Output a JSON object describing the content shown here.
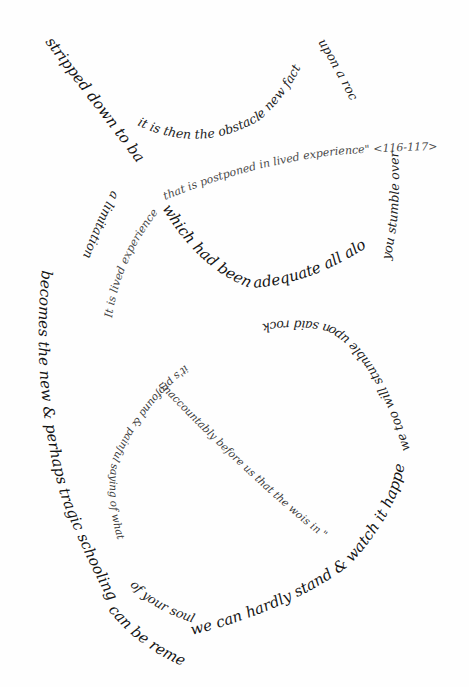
{
  "poem": {
    "colors": {
      "ink_dark": "#141414",
      "ink_light": "#4a4a4a",
      "paper": "#fefefe"
    },
    "lines": {
      "diagonal_top": "stripped down to basic words",
      "left_arc_a": "a limitation",
      "left_arc_b": "becomes the new & perhaps tragic schooling",
      "left_arc_c": "can be remembered",
      "top_loop": "it is then the obstacle new fact",
      "right_upper": "upon a rock",
      "right_side": "you stumble over",
      "big_loop_bottom": "which had been adequate all along",
      "quote_line": "that is postponed in lived experience\" <116-117>",
      "quote_start": "It is lived experience",
      "quote_mid": "experience",
      "lower_loop_top": "we too will stumble upon said rock",
      "lower_loop_left": "it's profound & painful saying of what",
      "lower_loop_left_end": "of your soul",
      "lower_loop_right": "we can hardly stand & watch it happen",
      "diagonal_lower": "unaccountably before us that the world spread out",
      "diagonal_end": "\" to the world",
      "diagonal_tail": "is in \""
    }
  }
}
